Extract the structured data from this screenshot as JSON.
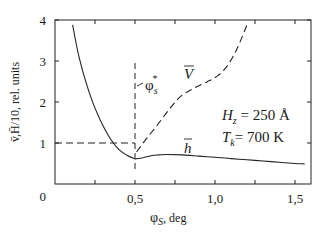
{
  "chart_data": {
    "type": "line",
    "title": "",
    "xlabel": "φS, deg",
    "xlabel_main": "φ",
    "xlabel_sub": "S",
    "xlabel_unit": ", deg",
    "ylabel": "v̄, H̄/10, rel. units",
    "ylabel_text": "v̄,H̄/10, rel. units",
    "xlim": [
      0,
      1.6
    ],
    "ylim": [
      0,
      4
    ],
    "x_ticks": [
      0.25,
      0.5,
      0.75,
      1.0,
      1.25,
      1.5
    ],
    "x_tick_labels": [
      {
        "value": 0.5,
        "label": "0,5"
      },
      {
        "value": 1.0,
        "label": "1,0"
      },
      {
        "value": 1.5,
        "label": "1,5"
      }
    ],
    "y_ticks": [
      1,
      2,
      3,
      4
    ],
    "y_tick_labels": [
      {
        "value": 0,
        "label": "0"
      },
      {
        "value": 1,
        "label": "1"
      },
      {
        "value": 2,
        "label": "2"
      },
      {
        "value": 3,
        "label": "3"
      },
      {
        "value": 4,
        "label": "4"
      }
    ],
    "grid": false,
    "legend": "none (inline labels)",
    "series": [
      {
        "name": "H̄/10 (left branch, solid)",
        "style": "solid",
        "x": [
          0.11,
          0.15,
          0.2,
          0.25,
          0.3,
          0.35,
          0.4,
          0.45,
          0.5
        ],
        "y": [
          3.88,
          3.1,
          2.4,
          1.85,
          1.42,
          1.08,
          0.84,
          0.7,
          0.61
        ]
      },
      {
        "name": "h̄",
        "label": "h",
        "style": "solid",
        "x": [
          0.5,
          0.55,
          0.6,
          0.65,
          0.7,
          0.8,
          0.9,
          1.0,
          1.1,
          1.2,
          1.3,
          1.4,
          1.5,
          1.56
        ],
        "y": [
          0.61,
          0.64,
          0.69,
          0.71,
          0.72,
          0.71,
          0.68,
          0.65,
          0.62,
          0.59,
          0.56,
          0.53,
          0.5,
          0.49
        ]
      },
      {
        "name": "V̄",
        "label": "V",
        "style": "dashed",
        "x": [
          0.51,
          0.57,
          0.64,
          0.71,
          0.78,
          0.86,
          0.95,
          1.02,
          1.08,
          1.14,
          1.2
        ],
        "y": [
          0.78,
          1.1,
          1.44,
          1.8,
          2.12,
          2.32,
          2.49,
          2.65,
          2.9,
          3.32,
          3.88
        ]
      }
    ],
    "reference_lines": [
      {
        "type": "horizontal",
        "style": "dashed",
        "y": 1.0,
        "x_from": 0,
        "x_to": 0.5
      },
      {
        "type": "vertical",
        "style": "dashed",
        "x": 0.5,
        "y_from": 0.3,
        "y_to": 2.95,
        "label": "φs*"
      }
    ],
    "annotations": [
      {
        "text": "φs*",
        "x": 0.56,
        "y": 2.45
      },
      {
        "text": "V",
        "x": 0.82,
        "y": 2.65,
        "overline": true
      },
      {
        "text": "h",
        "x": 0.83,
        "y": 0.95,
        "overline": true
      },
      {
        "text": "Hz = 250 Å",
        "x": 1.1,
        "y": 1.8
      },
      {
        "text": "Tk = 700 K",
        "x": 1.1,
        "y": 1.3
      }
    ]
  },
  "labels": {
    "phi_star_main": "φ",
    "phi_star_sub": "s",
    "phi_star_sup": "*",
    "v_label": "V",
    "h_label": "h",
    "hz_main": "H",
    "hz_sub": "z",
    "hz_rest": " = 250 ",
    "hz_unit": "Å",
    "tk_main": "T",
    "tk_sub": "k",
    "tk_rest": "= 700 K"
  }
}
